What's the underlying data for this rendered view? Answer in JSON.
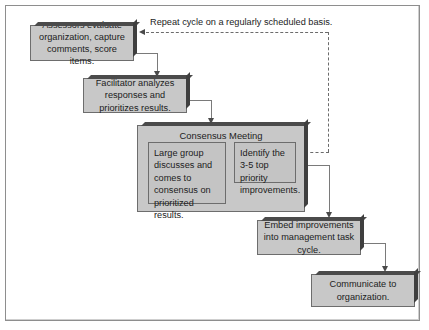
{
  "diagram": {
    "title_caption": "Repeat cycle on a regularly scheduled basis.",
    "colors": {
      "node_fill": "#c8c8c8",
      "node_border": "#6d6d6d",
      "node_shadow": "#4b4b4b",
      "subnode_fill": "#c4c4c4",
      "frame_border": "#8e8e8e",
      "connector": "#7a7a7a",
      "arrow": "#4a4a4a",
      "text": "#1c1c1c",
      "page_background": "#ffffff"
    },
    "nodes": [
      {
        "id": "assessors",
        "label": "Assessors evaluate organization, capture comments, score items.",
        "lines": [
          "Assessors evaluate",
          "organization, capture",
          "comments, score items."
        ]
      },
      {
        "id": "facilitator",
        "label": "Facilitator analyzes responses and prioritizes results.",
        "lines": [
          "Facilitator analyzes",
          "responses and",
          "prioritizes results."
        ]
      },
      {
        "id": "consensus-meeting",
        "label": "Consensus Meeting"
      },
      {
        "id": "large-group",
        "label": "Large group discusses and comes to consensus on prioritized results.",
        "lines": [
          "Large group",
          "discusses and",
          "comes to",
          "consensus on",
          "prioritized results."
        ]
      },
      {
        "id": "identify-improvements",
        "label": "Identify the 3-5 top priority improvements.",
        "lines": [
          "Identify the 3-5",
          "top priority",
          "improvements."
        ]
      },
      {
        "id": "embed",
        "label": "Embed improvements into management task cycle.",
        "lines": [
          "Embed improvements",
          "into management",
          "task cycle."
        ]
      },
      {
        "id": "communicate",
        "label": "Communicate to organization.",
        "lines": [
          "Communicate to",
          "organization."
        ]
      }
    ],
    "connectors": [
      {
        "from": "assessors",
        "to": "facilitator",
        "style": "solid",
        "arrow": "down"
      },
      {
        "from": "facilitator",
        "to": "consensus-meeting",
        "style": "solid",
        "arrow": "down"
      },
      {
        "from": "consensus-meeting",
        "to": "embed",
        "style": "solid",
        "arrow": "down"
      },
      {
        "from": "embed",
        "to": "communicate",
        "style": "solid",
        "arrow": "down"
      },
      {
        "from": "consensus-meeting",
        "to": "assessors",
        "style": "dashed",
        "arrow": "left",
        "label": "Repeat cycle on a regularly scheduled basis."
      }
    ]
  }
}
